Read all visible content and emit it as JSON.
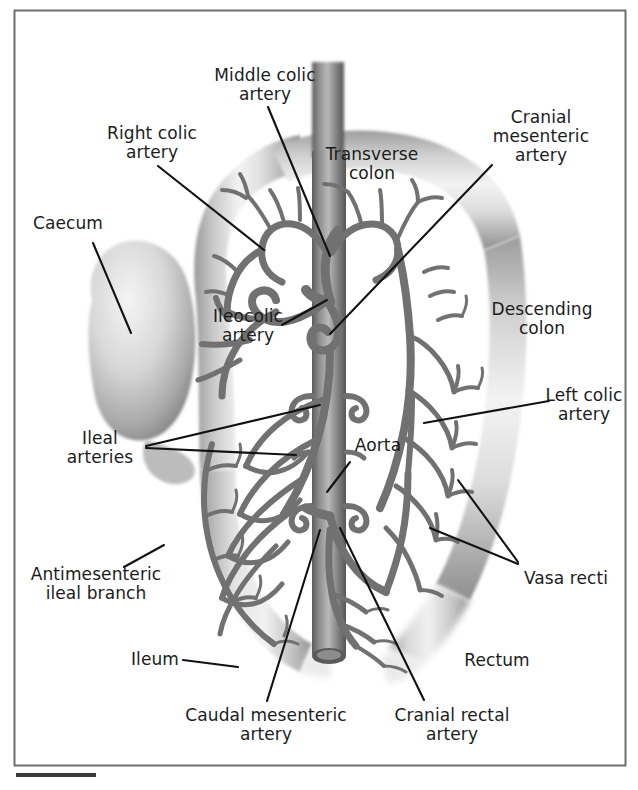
{
  "figure": {
    "kind": "anatomical-illustration",
    "frame_color": "#6b6b6b",
    "background_color": "#ffffff",
    "ink_color": "#1c1c1c",
    "vessel_color": "#6e6e6e",
    "organ_fill": "#d9d9d9",
    "scale_bar_color": "#3a3a3a"
  },
  "labels": {
    "middle_colic_artery": "Middle colic\nartery",
    "right_colic_artery": "Right colic\nartery",
    "caecum": "Caecum",
    "transverse_colon": "Transverse\ncolon",
    "cranial_mesenteric_artery": "Cranial\nmesenteric\nartery",
    "ileocolic_artery": "Ileocolic\nartery",
    "descending_colon": "Descending\ncolon",
    "left_colic_artery": "Left colic\nartery",
    "ileal_arteries": "Ileal\narteries",
    "aorta": "Aorta",
    "vasa_recti": "Vasa recti",
    "antimesenteric_ileal_branch": "Antimesenteric\nileal branch",
    "ileum": "Ileum",
    "rectum": "Rectum",
    "caudal_mesenteric_artery": "Caudal mesenteric\nartery",
    "cranial_rectal_artery": "Cranial rectal\nartery"
  },
  "label_lines": {
    "middle_colic_artery": [
      "Middle colic",
      "artery"
    ],
    "right_colic_artery": [
      "Right colic",
      "artery"
    ],
    "caecum": [
      "Caecum"
    ],
    "transverse_colon": [
      "Transverse",
      "colon"
    ],
    "cranial_mesenteric_artery": [
      "Cranial",
      "mesenteric",
      "artery"
    ],
    "ileocolic_artery": [
      "Ileocolic",
      "artery"
    ],
    "descending_colon": [
      "Descending",
      "colon"
    ],
    "left_colic_artery": [
      "Left colic",
      "artery"
    ],
    "ileal_arteries": [
      "Ileal",
      "arteries"
    ],
    "aorta": [
      "Aorta"
    ],
    "vasa_recti": [
      "Vasa recti"
    ],
    "antimesenteric_ileal_branch": [
      "Antimesenteric",
      "ileal branch"
    ],
    "ileum": [
      "Ileum"
    ],
    "rectum": [
      "Rectum"
    ],
    "caudal_mesenteric_artery": [
      "Caudal mesenteric",
      "artery"
    ],
    "cranial_rectal_artery": [
      "Cranial rectal",
      "artery"
    ]
  }
}
